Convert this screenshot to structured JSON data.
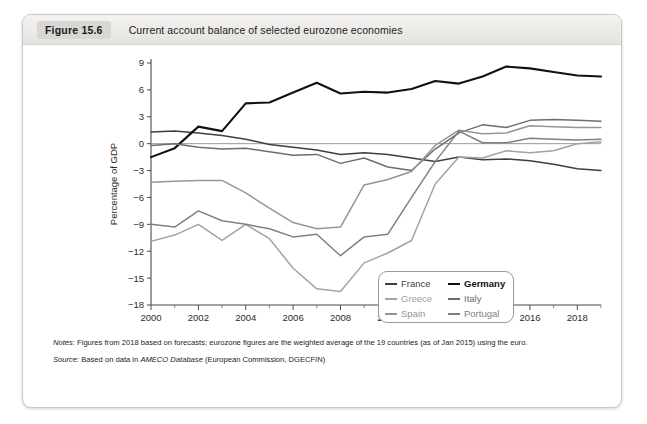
{
  "figure": {
    "number": "Figure 15.6",
    "title": "Current account balance of selected eurozone economies"
  },
  "notes": {
    "notes_lead": "Notes:",
    "notes_text": " Figures from 2018 based on forecasts; eurozone figures are the weighted average of the 19 countries (as of Jan 2015) using the euro.",
    "source_lead": "Source:",
    "source_pre": " Based on data in ",
    "source_em": "AMECO Database",
    "source_post": " (European Commission, DGECFIN)"
  },
  "chart_data": {
    "type": "line",
    "title": "Current account balance of selected eurozone economies",
    "xlabel": "",
    "ylabel": "Percentage of GDP",
    "xlim": [
      2000,
      2019
    ],
    "ylim": [
      -18,
      9
    ],
    "ytick_step": 3,
    "yticks": [
      9,
      6,
      3,
      0,
      -3,
      -6,
      -9,
      -12,
      -15,
      -18
    ],
    "xticks": [
      2000,
      2002,
      2004,
      2006,
      2008,
      2010,
      2012,
      2014,
      2016,
      2018
    ],
    "xminor_step": 1,
    "grid": false,
    "zero_line": true,
    "legend_position": "lower-right",
    "x": [
      2000,
      2001,
      2002,
      2003,
      2004,
      2005,
      2006,
      2007,
      2008,
      2009,
      2010,
      2011,
      2012,
      2013,
      2014,
      2015,
      2016,
      2017,
      2018,
      2019
    ],
    "series": [
      {
        "name": "France",
        "color": "#3f3f3f",
        "width": 1.5,
        "values": [
          1.3,
          1.4,
          1.2,
          0.9,
          0.5,
          -0.1,
          -0.4,
          -0.7,
          -1.2,
          -1.0,
          -1.2,
          -1.6,
          -2.0,
          -1.5,
          -1.8,
          -1.7,
          -1.9,
          -2.3,
          -2.8,
          -3.0
        ]
      },
      {
        "name": "Germany",
        "color": "#111111",
        "width": 2.1,
        "values": [
          -1.5,
          -0.5,
          1.9,
          1.4,
          4.5,
          4.6,
          5.7,
          6.8,
          5.6,
          5.8,
          5.7,
          6.1,
          7.0,
          6.7,
          7.5,
          8.6,
          8.4,
          8.0,
          7.6,
          7.5
        ]
      },
      {
        "name": "Greece",
        "color": "#a3a3a3",
        "width": 1.5,
        "values": [
          -10.9,
          -10.2,
          -9.0,
          -10.8,
          -9.0,
          -10.6,
          -13.9,
          -16.2,
          -16.5,
          -13.3,
          -12.2,
          -10.8,
          -4.5,
          -1.5,
          -1.6,
          -0.8,
          -1.0,
          -0.8,
          0.0,
          0.2
        ]
      },
      {
        "name": "Italy",
        "color": "#6e6e6e",
        "width": 1.5,
        "values": [
          -0.2,
          0.0,
          -0.4,
          -0.6,
          -0.5,
          -0.9,
          -1.3,
          -1.2,
          -2.2,
          -1.6,
          -2.6,
          -3.0,
          -0.6,
          1.2,
          2.1,
          1.8,
          2.6,
          2.7,
          2.6,
          2.5
        ]
      },
      {
        "name": "Spain",
        "color": "#959595",
        "width": 1.5,
        "values": [
          -4.3,
          -4.2,
          -4.1,
          -4.1,
          -5.5,
          -7.2,
          -8.8,
          -9.5,
          -9.3,
          -4.6,
          -4.0,
          -3.1,
          -0.2,
          1.5,
          1.1,
          1.2,
          2.0,
          1.9,
          1.8,
          1.8
        ]
      },
      {
        "name": "Portugal",
        "color": "#808080",
        "width": 1.5,
        "values": [
          -9.0,
          -9.3,
          -7.5,
          -8.6,
          -9.0,
          -9.5,
          -10.4,
          -10.1,
          -12.5,
          -10.4,
          -10.1,
          -6.0,
          -2.0,
          1.4,
          0.1,
          0.1,
          0.6,
          0.5,
          0.4,
          0.5
        ]
      }
    ],
    "legend_order": [
      "France",
      "Germany",
      "Greece",
      "Italy",
      "Spain",
      "Portugal"
    ]
  }
}
